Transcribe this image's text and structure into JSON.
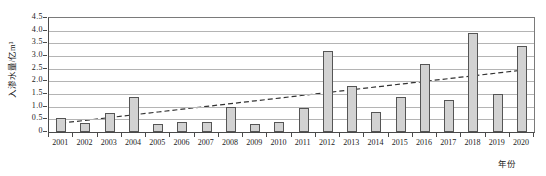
{
  "chart_data": {
    "type": "bar",
    "title": "",
    "xlabel": "年份",
    "ylabel": "入渗水量/亿m³",
    "ylim": [
      0,
      4.5
    ],
    "ytick_labels": [
      "0",
      "0.5",
      "1.0",
      "1.5",
      "2.0",
      "2.5",
      "3.0",
      "3.5",
      "4.0",
      "4.5"
    ],
    "ytick_values": [
      0,
      0.5,
      1.0,
      1.5,
      2.0,
      2.5,
      3.0,
      3.5,
      4.0,
      4.5
    ],
    "grid": true,
    "legend": "none",
    "categories": [
      "2001",
      "2002",
      "2003",
      "2004",
      "2005",
      "2006",
      "2007",
      "2008",
      "2009",
      "2010",
      "2011",
      "2012",
      "2013",
      "2014",
      "2015",
      "2016",
      "2017",
      "2018",
      "2019",
      "2020"
    ],
    "series": [
      {
        "name": "入渗水量",
        "type": "bar",
        "values": [
          0.55,
          0.35,
          0.75,
          1.4,
          0.3,
          0.4,
          0.4,
          1.0,
          0.3,
          0.4,
          0.95,
          3.2,
          1.8,
          0.8,
          1.4,
          2.7,
          1.25,
          3.9,
          1.5,
          3.4
        ]
      },
      {
        "name": "趋势线",
        "type": "line",
        "style": "dashed",
        "values": [
          0.35,
          0.46,
          0.57,
          0.68,
          0.79,
          0.9,
          1.01,
          1.12,
          1.23,
          1.34,
          1.45,
          1.56,
          1.67,
          1.78,
          1.89,
          2.0,
          2.11,
          2.22,
          2.33,
          2.44
        ]
      }
    ]
  }
}
